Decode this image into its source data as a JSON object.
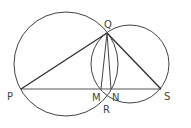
{
  "diagram": {
    "type": "geometry",
    "stroke_color": "#333333",
    "points": {
      "P": {
        "label": "P",
        "x": 21,
        "y": 89
      },
      "Q": {
        "label": "Q",
        "x": 107,
        "y": 33
      },
      "S": {
        "label": "S",
        "x": 161,
        "y": 89
      },
      "M": {
        "label": "M",
        "x": 101,
        "y": 89
      },
      "N": {
        "label": "N",
        "x": 111,
        "y": 89
      },
      "R": {
        "label": "R",
        "x": 108,
        "y": 97
      }
    },
    "circles": [
      {
        "name": "left-circle",
        "cx": 66,
        "cy": 64,
        "r": 52
      },
      {
        "name": "right-circle",
        "cx": 130,
        "cy": 64,
        "r": 39
      }
    ],
    "segments": [
      [
        "P",
        "Q"
      ],
      [
        "Q",
        "S"
      ],
      [
        "P",
        "S"
      ],
      [
        "Q",
        "M"
      ],
      [
        "Q",
        "N"
      ]
    ]
  }
}
